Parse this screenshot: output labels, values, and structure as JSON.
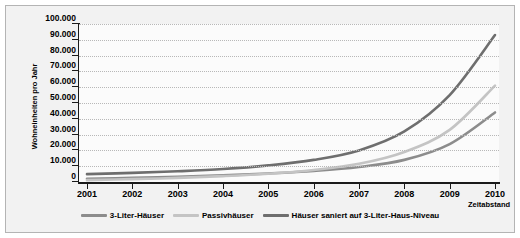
{
  "chart_data": {
    "type": "line",
    "title": "",
    "xlabel": "Zeitabstand",
    "ylabel": "Wohneinheiten pro Jahr",
    "x": [
      2001,
      2002,
      2003,
      2004,
      2005,
      2006,
      2007,
      2008,
      2009,
      2010
    ],
    "categories": [
      "2001",
      "2002",
      "2003",
      "2004",
      "2005",
      "2006",
      "2007",
      "2008",
      "2009",
      "2010"
    ],
    "xlim": [
      2001,
      2010
    ],
    "ylim": [
      0,
      100000
    ],
    "yticks": [
      0,
      10000,
      20000,
      30000,
      40000,
      50000,
      60000,
      70000,
      80000,
      90000,
      100000
    ],
    "ytick_labels": [
      "0",
      "10.000",
      "20.000",
      "30.000",
      "40.000",
      "50.000",
      "60.000",
      "70.000",
      "80.000",
      "90.000",
      "100.000"
    ],
    "grid": "horizontal-dotted",
    "legend_position": "bottom-center",
    "series": [
      {
        "name": "3-Liter-Häuser",
        "color": "#8c8c8c",
        "values": [
          2000,
          2600,
          3300,
          4200,
          5400,
          7000,
          9500,
          14000,
          24000,
          44000
        ]
      },
      {
        "name": "Passivhäuser",
        "color": "#c4c4c4",
        "values": [
          1200,
          1800,
          2600,
          3700,
          5200,
          7600,
          11500,
          19000,
          33000,
          61000
        ]
      },
      {
        "name": "Häuser saniert auf 3-Liter-Haus-Niveau",
        "color": "#6e6e6e",
        "values": [
          5000,
          5800,
          6800,
          8200,
          10500,
          14000,
          20000,
          32000,
          55000,
          93000
        ]
      }
    ]
  },
  "legend": {
    "items": [
      {
        "label": "3-Liter-Häuser"
      },
      {
        "label": "Passivhäuser"
      },
      {
        "label": "Häuser saniert auf 3-Liter-Haus-Niveau"
      }
    ]
  },
  "colors": {
    "series_1": "#8c8c8c",
    "series_2": "#c4c4c4",
    "series_3": "#6e6e6e",
    "panel_background": "#f2f2f2",
    "plot_background": "#fbfbfb",
    "axis": "#1a1a1a",
    "gridline": "#b8b8b8"
  }
}
